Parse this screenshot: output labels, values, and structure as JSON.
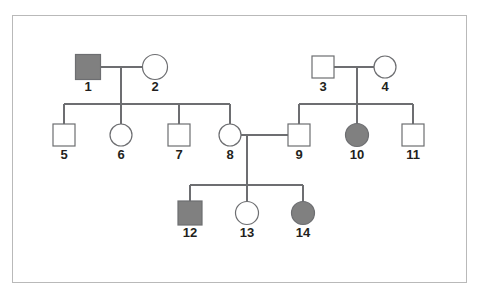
{
  "figure": {
    "title": "",
    "kind": "pedigree-chart",
    "border_color": "#b9b9b9",
    "line_color": "#6d6e71",
    "affected_fill": "#808080",
    "unaffected_fill": "#ffffff",
    "label_color": "#231f20",
    "background": "#ffffff"
  },
  "legend_symbols": {
    "square": "male",
    "circle": "female",
    "filled": "affected",
    "open": "unaffected"
  },
  "generations": [
    {
      "name": "I",
      "y": 67,
      "members": [
        "1",
        "2",
        "3",
        "4"
      ]
    },
    {
      "name": "II",
      "y": 135,
      "members": [
        "5",
        "6",
        "7",
        "8",
        "9",
        "10",
        "11"
      ]
    },
    {
      "name": "III",
      "y": 213,
      "members": [
        "12",
        "13",
        "14"
      ]
    }
  ],
  "individuals": [
    {
      "id": "1",
      "label": "1",
      "sex": "male",
      "shape": "square",
      "affected": true,
      "cx": 88,
      "cy": 67,
      "size": 25,
      "label_y": 79
    },
    {
      "id": "2",
      "label": "2",
      "sex": "female",
      "shape": "circle",
      "affected": false,
      "cx": 155,
      "cy": 67,
      "size": 25,
      "label_y": 79
    },
    {
      "id": "3",
      "label": "3",
      "sex": "male",
      "shape": "square",
      "affected": false,
      "cx": 323,
      "cy": 67,
      "size": 22,
      "label_y": 79
    },
    {
      "id": "4",
      "label": "4",
      "sex": "female",
      "shape": "circle",
      "affected": false,
      "cx": 385,
      "cy": 67,
      "size": 22,
      "label_y": 79
    },
    {
      "id": "5",
      "label": "5",
      "sex": "male",
      "shape": "square",
      "affected": false,
      "cx": 64,
      "cy": 135,
      "size": 22,
      "label_y": 147
    },
    {
      "id": "6",
      "label": "6",
      "sex": "female",
      "shape": "circle",
      "affected": false,
      "cx": 121,
      "cy": 135,
      "size": 22,
      "label_y": 147
    },
    {
      "id": "7",
      "label": "7",
      "sex": "male",
      "shape": "square",
      "affected": false,
      "cx": 179,
      "cy": 135,
      "size": 22,
      "label_y": 147
    },
    {
      "id": "8",
      "label": "8",
      "sex": "female",
      "shape": "circle",
      "affected": false,
      "cx": 230,
      "cy": 135,
      "size": 22,
      "label_y": 147
    },
    {
      "id": "9",
      "label": "9",
      "sex": "male",
      "shape": "square",
      "affected": false,
      "cx": 299,
      "cy": 135,
      "size": 22,
      "label_y": 147
    },
    {
      "id": "10",
      "label": "10",
      "sex": "female",
      "shape": "circle",
      "affected": true,
      "cx": 357,
      "cy": 135,
      "size": 23,
      "label_y": 147
    },
    {
      "id": "11",
      "label": "11",
      "sex": "male",
      "shape": "square",
      "affected": false,
      "cx": 413,
      "cy": 135,
      "size": 22,
      "label_y": 147
    },
    {
      "id": "12",
      "label": "12",
      "sex": "male",
      "shape": "square",
      "affected": true,
      "cx": 190,
      "cy": 213,
      "size": 24,
      "label_y": 225
    },
    {
      "id": "13",
      "label": "13",
      "sex": "female",
      "shape": "circle",
      "affected": false,
      "cx": 247,
      "cy": 213,
      "size": 23,
      "label_y": 225
    },
    {
      "id": "14",
      "label": "14",
      "sex": "female",
      "shape": "circle",
      "affected": true,
      "cx": 303,
      "cy": 213,
      "size": 23,
      "label_y": 225
    }
  ],
  "matings": [
    {
      "id": "m1",
      "partners": [
        "1",
        "2"
      ],
      "line_y": 67,
      "descent_x": 121,
      "sib_y": 104,
      "children": [
        "5",
        "6",
        "7",
        "8"
      ]
    },
    {
      "id": "m2",
      "partners": [
        "3",
        "4"
      ],
      "line_y": 67,
      "descent_x": 357,
      "sib_y": 104,
      "children": [
        "9",
        "10",
        "11"
      ]
    },
    {
      "id": "m3",
      "partners": [
        "8",
        "9"
      ],
      "line_y": 135,
      "descent_x": 247,
      "sib_y": 185,
      "children": [
        "12",
        "13",
        "14"
      ]
    }
  ]
}
